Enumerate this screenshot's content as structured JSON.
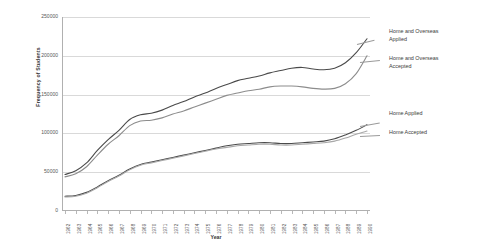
{
  "chart_data": {
    "type": "line",
    "title": "",
    "xlabel": "Year",
    "ylabel": "Frequency of Students",
    "ylim": [
      0,
      250000
    ],
    "yticks": [
      0,
      50000,
      100000,
      150000,
      200000,
      250000
    ],
    "ytick_labels": [
      "0",
      "50000",
      "100000",
      "150000",
      "200000",
      "250000"
    ],
    "grid": true,
    "legend_position": "right-inline-annotations",
    "categories": [
      "1962",
      "1963",
      "1964",
      "1965",
      "1966",
      "1967",
      "1968",
      "1969",
      "1970",
      "1971",
      "1972",
      "1973",
      "1974",
      "1975",
      "1976",
      "1977",
      "1978",
      "1979",
      "1980",
      "1981",
      "1982",
      "1983",
      "1984",
      "1985",
      "1986",
      "1987",
      "1988",
      "1989",
      "1990"
    ],
    "series": [
      {
        "name": "Home and Overseas Applied",
        "color": "#4a4a4a",
        "values": [
          47000,
          52000,
          62000,
          78000,
          92000,
          104000,
          118000,
          124000,
          126000,
          130000,
          136000,
          141000,
          147000,
          152000,
          158000,
          163000,
          168000,
          171000,
          174000,
          178000,
          181000,
          184000,
          185000,
          183000,
          182000,
          184000,
          191000,
          204000,
          222000
        ]
      },
      {
        "name": "Home and Overseas Accepted",
        "color": "#8c8c8c",
        "values": [
          44000,
          48000,
          57000,
          72000,
          86000,
          97000,
          110000,
          116000,
          117000,
          120000,
          125000,
          129000,
          134000,
          139000,
          144000,
          149000,
          152000,
          155000,
          157000,
          160000,
          161000,
          161000,
          160000,
          158000,
          157000,
          158000,
          164000,
          177000,
          200000
        ]
      },
      {
        "name": "Home Applied",
        "color": "#4a4a4a",
        "values": [
          19000,
          20000,
          24000,
          31000,
          39000,
          46000,
          54000,
          60000,
          63000,
          66000,
          69000,
          72000,
          75000,
          78000,
          81000,
          84000,
          86000,
          87000,
          88000,
          88000,
          87000,
          87000,
          88000,
          89000,
          90000,
          93000,
          98000,
          104000,
          111000
        ]
      },
      {
        "name": "Home Accepted",
        "color": "#a8a8a8",
        "values": [
          18000,
          19000,
          23000,
          30000,
          38000,
          45000,
          53000,
          59000,
          62000,
          65000,
          68000,
          71000,
          74000,
          77000,
          80000,
          82000,
          84000,
          85000,
          86000,
          86000,
          85000,
          85000,
          86000,
          87000,
          88000,
          90000,
          94000,
          99000,
          103000
        ]
      }
    ],
    "annotations": [
      {
        "id": "ann1",
        "text": "Home and Overseas\nApplied"
      },
      {
        "id": "ann2",
        "text": "Home and Overseas\nAccepted"
      },
      {
        "id": "ann3",
        "text": "Home Applied"
      },
      {
        "id": "ann4",
        "text": "Home Accepted"
      }
    ]
  }
}
